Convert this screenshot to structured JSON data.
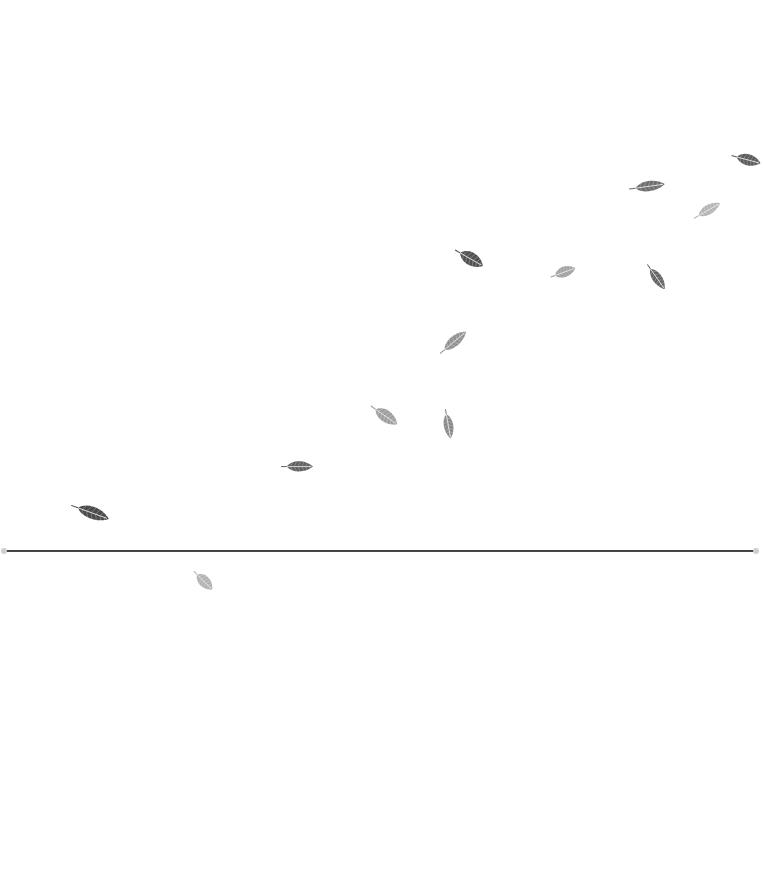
{
  "scene": {
    "description": "Feathers drifting diagonally upward to the right above a thin horizontal line",
    "background": "#ffffff",
    "horizon": {
      "y": 551,
      "x_start": 5,
      "x_end": 755,
      "color": "#2f2f2f",
      "endcap_color": "#cfcfcf"
    },
    "feathers": [
      {
        "cx": 746,
        "cy": 159,
        "len": 30,
        "w": 13,
        "angle": 15,
        "shade": "#4a4a4a",
        "opacity": 0.9
      },
      {
        "cx": 647,
        "cy": 187,
        "len": 36,
        "w": 12,
        "angle": -8,
        "shade": "#555555",
        "opacity": 0.85
      },
      {
        "cx": 707,
        "cy": 211,
        "len": 30,
        "w": 11,
        "angle": -30,
        "shade": "#9a9a9a",
        "opacity": 0.75
      },
      {
        "cx": 469,
        "cy": 258,
        "len": 32,
        "w": 15,
        "angle": 30,
        "shade": "#3f3f3f",
        "opacity": 0.9
      },
      {
        "cx": 563,
        "cy": 273,
        "len": 26,
        "w": 12,
        "angle": -20,
        "shade": "#8a8a8a",
        "opacity": 0.8
      },
      {
        "cx": 656,
        "cy": 277,
        "len": 30,
        "w": 11,
        "angle": 55,
        "shade": "#4e4e4e",
        "opacity": 0.88
      },
      {
        "cx": 453,
        "cy": 343,
        "len": 34,
        "w": 12,
        "angle": -40,
        "shade": "#777777",
        "opacity": 0.8
      },
      {
        "cx": 384,
        "cy": 415,
        "len": 32,
        "w": 14,
        "angle": 35,
        "shade": "#888888",
        "opacity": 0.8
      },
      {
        "cx": 448,
        "cy": 424,
        "len": 30,
        "w": 11,
        "angle": 80,
        "shade": "#707070",
        "opacity": 0.82
      },
      {
        "cx": 297,
        "cy": 467,
        "len": 32,
        "w": 12,
        "angle": 0,
        "shade": "#4c4c4c",
        "opacity": 0.88
      },
      {
        "cx": 90,
        "cy": 512,
        "len": 40,
        "w": 14,
        "angle": 20,
        "shade": "#3c3c3c",
        "opacity": 0.92
      },
      {
        "cx": 203,
        "cy": 580,
        "len": 26,
        "w": 13,
        "angle": 45,
        "shade": "#9c9c9c",
        "opacity": 0.78
      }
    ]
  }
}
